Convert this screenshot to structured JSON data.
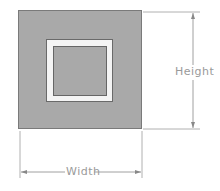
{
  "diagram": {
    "type": "dimensioned-square-frame",
    "labels": {
      "height": "Height",
      "width": "Width"
    },
    "colors": {
      "fill": "#a9a9a9",
      "band": "#f4f4f4",
      "line": "#9a9a9a"
    }
  }
}
